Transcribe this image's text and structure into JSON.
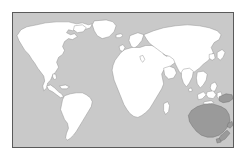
{
  "figure": {
    "type": "world-map",
    "title": "",
    "projection": "equirectangular",
    "frame": {
      "border_color": "#5a5a5a",
      "x": 12,
      "y": 12,
      "width": 222,
      "height": 136
    },
    "background_color": "#ffffff",
    "ocean_color": "#c9c9c9",
    "land_color": "#ffffff",
    "land_outline_color": "#8a8a8a",
    "highlight_color": "#9a9a9a",
    "highlight_outline_color": "#6e6e6e"
  },
  "legend": {
    "visible": false,
    "entries": []
  },
  "labels": {
    "visible": false,
    "items": []
  },
  "regions": [
    {
      "name": "north-america",
      "highlighted": false
    },
    {
      "name": "greenland",
      "highlighted": false
    },
    {
      "name": "south-america",
      "highlighted": false
    },
    {
      "name": "africa",
      "highlighted": false
    },
    {
      "name": "madagascar",
      "highlighted": false
    },
    {
      "name": "europe",
      "highlighted": false
    },
    {
      "name": "asia",
      "highlighted": false
    },
    {
      "name": "british-isles",
      "highlighted": false
    },
    {
      "name": "japan",
      "highlighted": false
    },
    {
      "name": "philippines",
      "highlighted": false
    },
    {
      "name": "indonesia",
      "highlighted": false
    },
    {
      "name": "borneo",
      "highlighted": false
    },
    {
      "name": "sumatra",
      "highlighted": false
    },
    {
      "name": "iceland",
      "highlighted": false
    },
    {
      "name": "sri-lanka",
      "highlighted": false
    },
    {
      "name": "australia",
      "highlighted": true
    },
    {
      "name": "new-guinea",
      "highlighted": true
    },
    {
      "name": "new-zealand",
      "highlighted": true
    },
    {
      "name": "tasmania",
      "highlighted": true
    }
  ],
  "chart_data": {
    "type": "map",
    "title": "",
    "xlabel": "",
    "ylabel": "",
    "highlighted_regions": [
      "Australia",
      "New Guinea",
      "New Zealand",
      "Tasmania"
    ],
    "categories": [
      "North America",
      "South America",
      "Greenland",
      "Europe",
      "Africa",
      "Asia",
      "Australia",
      "New Guinea",
      "New Zealand",
      "Tasmania",
      "Madagascar",
      "Japan",
      "Indonesia",
      "Philippines",
      "British Isles",
      "Iceland",
      "Sri Lanka",
      "Borneo",
      "Sumatra"
    ],
    "values": [
      0,
      0,
      0,
      0,
      0,
      0,
      1,
      1,
      1,
      1,
      0,
      0,
      0,
      0,
      0,
      0,
      0,
      0,
      0
    ],
    "value_legend": {
      "0": "not highlighted",
      "1": "highlighted"
    },
    "grid": false,
    "legend_position": "none"
  }
}
